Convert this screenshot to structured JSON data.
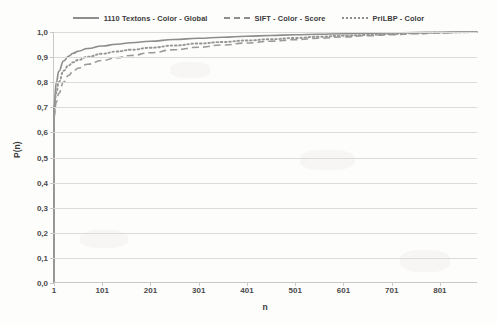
{
  "chart_data": {
    "type": "line",
    "title": "",
    "xlabel": "n",
    "ylabel": "P(n)",
    "xlim": [
      1,
      880
    ],
    "ylim": [
      0.0,
      1.0
    ],
    "grid": true,
    "legend_position": "top-center",
    "x_ticks": [
      "1",
      "101",
      "201",
      "301",
      "401",
      "501",
      "601",
      "701",
      "801"
    ],
    "x_tick_values": [
      1,
      101,
      201,
      301,
      401,
      501,
      601,
      701,
      801
    ],
    "y_ticks": [
      "0,0",
      "0,1",
      "0,2",
      "0,3",
      "0,4",
      "0,5",
      "0,6",
      "0,7",
      "0,8",
      "0,9",
      "1,0"
    ],
    "y_tick_values": [
      0.0,
      0.1,
      0.2,
      0.3,
      0.4,
      0.5,
      0.6,
      0.7,
      0.8,
      0.9,
      1.0
    ],
    "x": [
      1,
      6,
      11,
      21,
      31,
      41,
      51,
      71,
      101,
      131,
      161,
      201,
      251,
      301,
      351,
      401,
      451,
      501,
      551,
      601,
      651,
      701,
      751,
      801,
      851,
      880
    ],
    "series": [
      {
        "name": "1110  Textons - Color - Global",
        "style": "solid",
        "color": "#8d8d8d",
        "values": [
          0.7,
          0.8,
          0.843,
          0.884,
          0.903,
          0.915,
          0.923,
          0.934,
          0.944,
          0.951,
          0.957,
          0.963,
          0.97,
          0.975,
          0.979,
          0.983,
          0.986,
          0.989,
          0.991,
          0.993,
          0.995,
          0.996,
          0.998,
          0.999,
          1.0,
          1.0
        ]
      },
      {
        "name": "SIFT - Color - Score",
        "style": "dashed",
        "color": "#9a9a9a",
        "values": [
          0.66,
          0.72,
          0.755,
          0.8,
          0.826,
          0.843,
          0.855,
          0.871,
          0.886,
          0.897,
          0.906,
          0.917,
          0.929,
          0.939,
          0.948,
          0.956,
          0.963,
          0.969,
          0.975,
          0.98,
          0.985,
          0.989,
          0.993,
          0.996,
          0.999,
          1.0
        ]
      },
      {
        "name": "PriLBP - Color",
        "style": "dotted",
        "color": "#969696",
        "values": [
          0.675,
          0.76,
          0.8,
          0.845,
          0.866,
          0.879,
          0.888,
          0.901,
          0.913,
          0.922,
          0.929,
          0.937,
          0.946,
          0.954,
          0.96,
          0.966,
          0.971,
          0.976,
          0.981,
          0.985,
          0.988,
          0.992,
          0.995,
          0.997,
          0.999,
          1.0
        ]
      }
    ]
  },
  "legend": {
    "entries": [
      {
        "label": "1110  Textons - Color - Global",
        "style": "solid"
      },
      {
        "label": "SIFT - Color - Score",
        "style": "dashed"
      },
      {
        "label": "PriLBP - Color",
        "style": "dotted"
      }
    ]
  },
  "axes": {
    "x_title": "n",
    "y_title": "P(n)"
  }
}
